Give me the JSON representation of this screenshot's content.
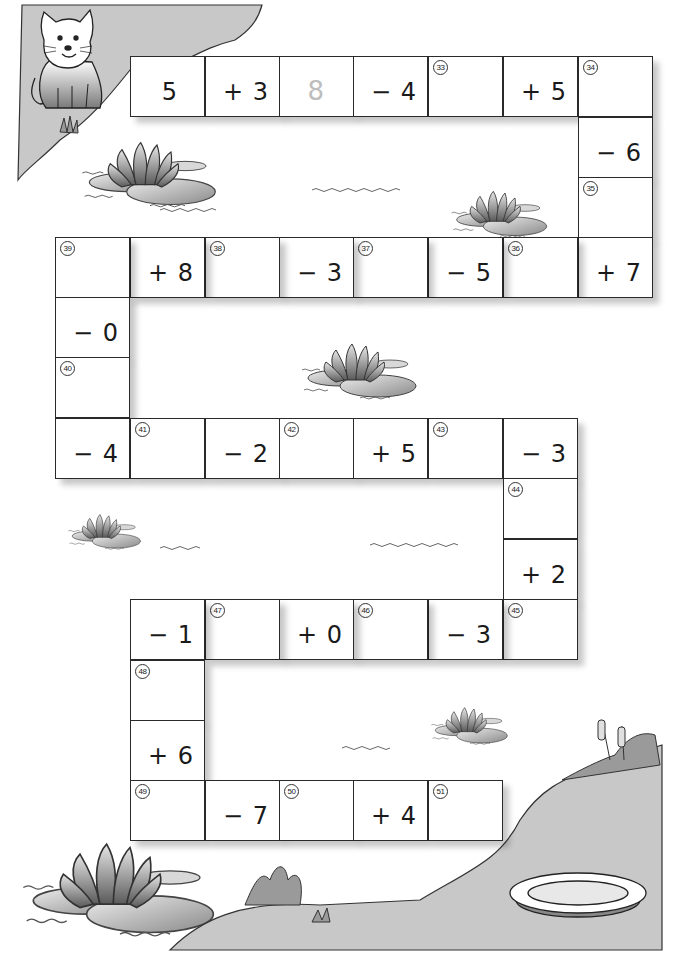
{
  "worksheet": {
    "title_fragment": "",
    "start_value": "5",
    "example_answer": "8",
    "colors": {
      "cell_border": "#2a2a2a",
      "cell_fill": "#ffffff",
      "shore_gray": "#c8c8c8",
      "text": "#1a1a1a",
      "hint_text": "#bdbdbd"
    }
  },
  "path_cells": [
    {
      "id": "c1",
      "type": "value",
      "text": "5",
      "x": 130,
      "y": 56
    },
    {
      "id": "c2",
      "type": "op",
      "text": "+ 3",
      "x": 205,
      "y": 56
    },
    {
      "id": "c3",
      "type": "answer-hint",
      "text": "8",
      "x": 279,
      "y": 56
    },
    {
      "id": "c4",
      "type": "op",
      "text": "− 4",
      "x": 353,
      "y": 56
    },
    {
      "id": "c5",
      "type": "answer",
      "num": "33",
      "x": 428,
      "y": 56
    },
    {
      "id": "c6",
      "type": "op",
      "text": "+ 5",
      "x": 503,
      "y": 56
    },
    {
      "id": "c7",
      "type": "answer",
      "num": "34",
      "x": 578,
      "y": 56
    },
    {
      "id": "c8",
      "type": "op",
      "text": "− 6",
      "x": 578,
      "y": 117
    },
    {
      "id": "c9",
      "type": "answer",
      "num": "35",
      "x": 578,
      "y": 177
    },
    {
      "id": "c10",
      "type": "op",
      "text": "+ 7",
      "x": 578,
      "y": 237
    },
    {
      "id": "c11",
      "type": "answer",
      "num": "36",
      "x": 503,
      "y": 237
    },
    {
      "id": "c12",
      "type": "op",
      "text": "− 5",
      "x": 428,
      "y": 237
    },
    {
      "id": "c13",
      "type": "answer",
      "num": "37",
      "x": 353,
      "y": 237
    },
    {
      "id": "c14",
      "type": "op",
      "text": "− 3",
      "x": 279,
      "y": 237
    },
    {
      "id": "c15",
      "type": "answer",
      "num": "38",
      "x": 205,
      "y": 237
    },
    {
      "id": "c16",
      "type": "op",
      "text": "+ 8",
      "x": 130,
      "y": 237
    },
    {
      "id": "c17",
      "type": "answer",
      "num": "39",
      "x": 55,
      "y": 237
    },
    {
      "id": "c18",
      "type": "op",
      "text": "− 0",
      "x": 55,
      "y": 297
    },
    {
      "id": "c19",
      "type": "answer",
      "num": "40",
      "x": 55,
      "y": 357
    },
    {
      "id": "c20",
      "type": "op",
      "text": "− 4",
      "x": 55,
      "y": 418
    },
    {
      "id": "c21",
      "type": "answer",
      "num": "41",
      "x": 130,
      "y": 418
    },
    {
      "id": "c22",
      "type": "op",
      "text": "− 2",
      "x": 205,
      "y": 418
    },
    {
      "id": "c23",
      "type": "answer",
      "num": "42",
      "x": 279,
      "y": 418
    },
    {
      "id": "c24",
      "type": "op",
      "text": "+ 5",
      "x": 353,
      "y": 418
    },
    {
      "id": "c25",
      "type": "answer",
      "num": "43",
      "x": 428,
      "y": 418
    },
    {
      "id": "c26",
      "type": "op",
      "text": "− 3",
      "x": 503,
      "y": 418
    },
    {
      "id": "c27",
      "type": "answer",
      "num": "44",
      "x": 503,
      "y": 478
    },
    {
      "id": "c28",
      "type": "op",
      "text": "+ 2",
      "x": 503,
      "y": 539
    },
    {
      "id": "c29",
      "type": "answer",
      "num": "45",
      "x": 503,
      "y": 599
    },
    {
      "id": "c30",
      "type": "op",
      "text": "− 3",
      "x": 428,
      "y": 599
    },
    {
      "id": "c31",
      "type": "answer",
      "num": "46",
      "x": 353,
      "y": 599
    },
    {
      "id": "c32",
      "type": "op",
      "text": "+ 0",
      "x": 279,
      "y": 599
    },
    {
      "id": "c33",
      "type": "answer",
      "num": "47",
      "x": 205,
      "y": 599
    },
    {
      "id": "c34",
      "type": "op",
      "text": "− 1",
      "x": 130,
      "y": 599
    },
    {
      "id": "c35",
      "type": "answer",
      "num": "48",
      "x": 130,
      "y": 660
    },
    {
      "id": "c36",
      "type": "op",
      "text": "+ 6",
      "x": 130,
      "y": 720
    },
    {
      "id": "c37",
      "type": "answer",
      "num": "49",
      "x": 130,
      "y": 780
    },
    {
      "id": "c38",
      "type": "op",
      "text": "− 7",
      "x": 205,
      "y": 780
    },
    {
      "id": "c39",
      "type": "answer",
      "num": "50",
      "x": 279,
      "y": 780
    },
    {
      "id": "c40",
      "type": "op",
      "text": "+ 4",
      "x": 353,
      "y": 780
    },
    {
      "id": "c41",
      "type": "answer",
      "num": "51",
      "x": 428,
      "y": 780
    }
  ],
  "illustrations": {
    "cat": "cat-illustration",
    "lilies": [
      "water-lily-top-left",
      "water-lily-top-right",
      "water-lily-middle",
      "water-lily-left",
      "water-lily-lower-right",
      "water-lily-bottom-left"
    ],
    "bowl": "milk-bowl",
    "reeds": "cattail-reeds"
  }
}
